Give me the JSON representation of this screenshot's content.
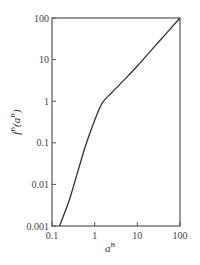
{
  "chart_data": {
    "type": "line",
    "title": "",
    "xlabel": "a^B",
    "ylabel": "f^B(a^B)",
    "xscale": "log",
    "yscale": "log",
    "xlim": [
      0.1,
      100
    ],
    "ylim": [
      0.001,
      100
    ],
    "x_ticks": [
      "0.1",
      "1",
      "10",
      "100"
    ],
    "y_ticks": [
      "0.001",
      "0.01",
      "0.1",
      "1",
      "10",
      "100"
    ],
    "grid": false,
    "series": [
      {
        "name": "f^B(a^B)",
        "x": [
          0.15,
          0.25,
          0.4,
          0.6,
          1.0,
          1.5,
          2.5,
          5,
          10,
          30,
          100
        ],
        "values": [
          0.001,
          0.004,
          0.02,
          0.08,
          0.35,
          0.9,
          1.6,
          3.3,
          7,
          25,
          100
        ]
      }
    ]
  },
  "labels": {
    "xlabel_main": "a",
    "xlabel_sup": "B",
    "ylabel_f": "f",
    "ylabel_sup": "B",
    "ylabel_arg": "(a",
    "ylabel_arg_sup": "B",
    "ylabel_close": ")"
  }
}
